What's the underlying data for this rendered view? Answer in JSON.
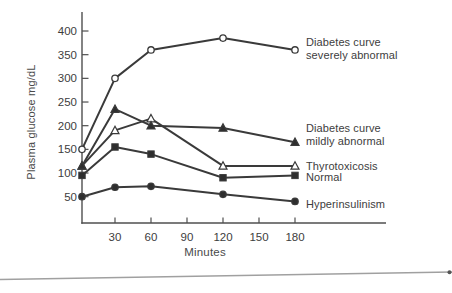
{
  "figure": {
    "kind": "scanned textbook line chart",
    "bottom_rule": true
  },
  "colors": {
    "line": "#3a3a3a",
    "marker_fill": "#2e2e2e",
    "axis": "#4f4f4f",
    "text": "#3d3d3d",
    "rule": "#a0a0a0",
    "background": "#ffffff"
  },
  "chart_data": {
    "type": "line",
    "title": "",
    "xlabel": "Minutes",
    "ylabel": "Plasma glucose mg/dL",
    "x": [
      0,
      30,
      60,
      120,
      180
    ],
    "x_tick_labels": [
      30,
      60,
      90,
      120,
      150,
      180
    ],
    "y_tick_labels": [
      50,
      100,
      150,
      200,
      250,
      300,
      350,
      400
    ],
    "xlim": [
      0,
      255
    ],
    "ylim": [
      0,
      425
    ],
    "grid": false,
    "legend_position": "right of each line end",
    "series": [
      {
        "name": "Diabetes curve severely abnormal",
        "label": "Diabetes curve\nseverely abnormal",
        "marker": "circle-open",
        "values": [
          150,
          300,
          360,
          385,
          360
        ]
      },
      {
        "name": "Diabetes curve mildly abnormal",
        "label": "Diabetes curve\nmildly abnormal",
        "marker": "triangle-filled",
        "values": [
          115,
          235,
          200,
          195,
          165
        ]
      },
      {
        "name": "Thyrotoxicosis",
        "label": "Thyrotoxicosis",
        "marker": "triangle-open",
        "values": [
          115,
          190,
          215,
          115,
          115
        ]
      },
      {
        "name": "Normal",
        "label": "Normal",
        "marker": "square-filled",
        "values": [
          95,
          155,
          140,
          90,
          95
        ]
      },
      {
        "name": "Hyperinsulinism",
        "label": "Hyperinsulinism",
        "marker": "circle-filled",
        "values": [
          50,
          70,
          72,
          55,
          40
        ]
      }
    ]
  }
}
